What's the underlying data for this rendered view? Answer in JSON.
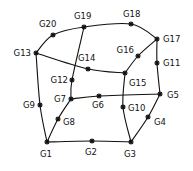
{
  "diagram": {
    "type": "mesh-element",
    "nodes": [
      {
        "id": "G1",
        "label": "G1"
      },
      {
        "id": "G2",
        "label": "G2"
      },
      {
        "id": "G3",
        "label": "G3"
      },
      {
        "id": "G4",
        "label": "G4"
      },
      {
        "id": "G5",
        "label": "G5"
      },
      {
        "id": "G6",
        "label": "G6"
      },
      {
        "id": "G7",
        "label": "G7"
      },
      {
        "id": "G8",
        "label": "G8"
      },
      {
        "id": "G9",
        "label": "G9"
      },
      {
        "id": "G10",
        "label": "G10"
      },
      {
        "id": "G11",
        "label": "G11"
      },
      {
        "id": "G12",
        "label": "G12"
      },
      {
        "id": "G13",
        "label": "G13"
      },
      {
        "id": "G14",
        "label": "G14"
      },
      {
        "id": "G15",
        "label": "G15"
      },
      {
        "id": "G16",
        "label": "G16"
      },
      {
        "id": "G17",
        "label": "G17"
      },
      {
        "id": "G18",
        "label": "G18"
      },
      {
        "id": "G19",
        "label": "G19"
      },
      {
        "id": "G20",
        "label": "G20"
      }
    ],
    "edges": [
      {
        "path": [
          "G13",
          "G20",
          "G19",
          "G18",
          "G17"
        ]
      },
      {
        "path": [
          "G13",
          "G14",
          "G15"
        ]
      },
      {
        "path": [
          "G15",
          "G16",
          "G17"
        ]
      },
      {
        "path": [
          "G17",
          "G11",
          "G5"
        ]
      },
      {
        "path": [
          "G19",
          "G12",
          "G7"
        ]
      },
      {
        "path": [
          "G7",
          "G6",
          "G5"
        ]
      },
      {
        "path": [
          "G7",
          "G8",
          "G1"
        ]
      },
      {
        "path": [
          "G13",
          "G9",
          "G1"
        ]
      },
      {
        "path": [
          "G1",
          "G2",
          "G3"
        ]
      },
      {
        "path": [
          "G3",
          "G4",
          "G5"
        ]
      },
      {
        "path": [
          "G15",
          "G10",
          "G3"
        ]
      }
    ]
  }
}
